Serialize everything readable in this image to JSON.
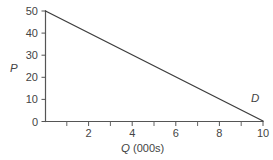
{
  "chart_data": {
    "type": "line",
    "title": "",
    "subtitle": "",
    "xlabel": "Q (000s)",
    "xlabel_symbol": "Q",
    "xlabel_unit": "(000s)",
    "ylabel": "P",
    "xlim": [
      0,
      10
    ],
    "ylim": [
      0,
      50
    ],
    "grid": false,
    "legend": "none",
    "x_major_ticks": [
      0,
      2,
      4,
      6,
      8,
      10
    ],
    "x_major_tick_labels": [
      "",
      "2",
      "4",
      "6",
      "8",
      "10"
    ],
    "x_minor_ticks": [
      1,
      3,
      5,
      7,
      9
    ],
    "y_ticks": [
      0,
      10,
      20,
      30,
      40,
      50
    ],
    "y_tick_labels": [
      "0",
      "10",
      "20",
      "30",
      "40",
      "50"
    ],
    "series": [
      {
        "name": "D",
        "label": "D",
        "label_x": 9.45,
        "label_y": 8.5,
        "color": "#3d3d3d",
        "x": [
          0,
          10
        ],
        "values": [
          50,
          0
        ],
        "equation": "P = 50 - 5Q"
      }
    ]
  },
  "figure": {
    "background_color": "#ffffff",
    "axis_color": "#555555",
    "text_color": "#444444"
  }
}
